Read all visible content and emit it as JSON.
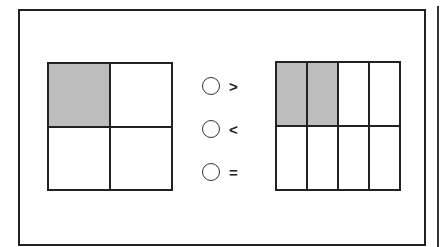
{
  "left_fraction": {
    "rows": 2,
    "cols": 2,
    "shaded": [
      true,
      false,
      false,
      false
    ],
    "shade_color": "#bdbdbd"
  },
  "right_fraction": {
    "rows": 2,
    "cols": 4,
    "shaded": [
      true,
      true,
      false,
      false,
      false,
      false,
      false,
      false
    ],
    "shade_color": "#bdbdbd"
  },
  "options": [
    {
      "symbol": ">",
      "selected": false
    },
    {
      "symbol": "<",
      "selected": false
    },
    {
      "symbol": "=",
      "selected": false
    }
  ]
}
